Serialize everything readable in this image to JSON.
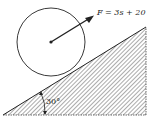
{
  "diagram": {
    "force_label": "F = 3s + 20",
    "angle_label": "30°",
    "incline_angle_deg": 30,
    "colors": {
      "stroke": "#222222",
      "background": "#ffffff"
    }
  }
}
